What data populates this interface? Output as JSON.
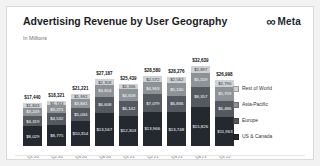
{
  "header": {
    "title": "Advertising Revenue by User Geography",
    "subtitle": "In Millions",
    "brand": "Meta",
    "brand_icon": "infinity",
    "brand_color": "#1c2b33"
  },
  "chart_data": {
    "type": "bar",
    "stacked": true,
    "title": "Advertising Revenue by User Geography",
    "subtitle": "In Millions",
    "value_prefix": "$",
    "unit": "USD millions",
    "legend_position": "right",
    "grid": false,
    "ylim": [
      0,
      32639
    ],
    "categories": [
      "Q1'20",
      "Q2'20",
      "Q3'20",
      "Q4'20",
      "Q1'21",
      "Q2'21",
      "Q3'21",
      "Q4'21",
      "Q1'22"
    ],
    "series": [
      {
        "name": "US & Canada",
        "color": "#23292e",
        "text_color": "#ffffff",
        "values": [
          8029,
          8775,
          10354,
          13567,
          12303,
          13966,
          13748,
          15826,
          11963
        ]
      },
      {
        "name": "Europe",
        "color": "#54595f",
        "text_color": "#ffffff",
        "values": [
          4319,
          4532,
          5034,
          6608,
          6142,
          7079,
          6836,
          8357,
          6486
        ]
      },
      {
        "name": "Asia-Pacific",
        "color": "#8d9297",
        "text_color": "#ffffff",
        "values": [
          3249,
          3271,
          3841,
          4654,
          4658,
          4963,
          5130,
          5559,
          5759
        ]
      },
      {
        "name": "Rest of World",
        "color": "#cfd2d4",
        "text_color": "#33373a",
        "values": [
          1843,
          1743,
          1992,
          2358,
          2336,
          2572,
          2562,
          2897,
          2790
        ]
      }
    ],
    "totals": [
      17440,
      18321,
      21221,
      27187,
      25439,
      28580,
      28276,
      32639,
      26998
    ],
    "legend_order_top_to_bottom": [
      "Rest of World",
      "Asia-Pacific",
      "Europe",
      "US & Canada"
    ]
  }
}
